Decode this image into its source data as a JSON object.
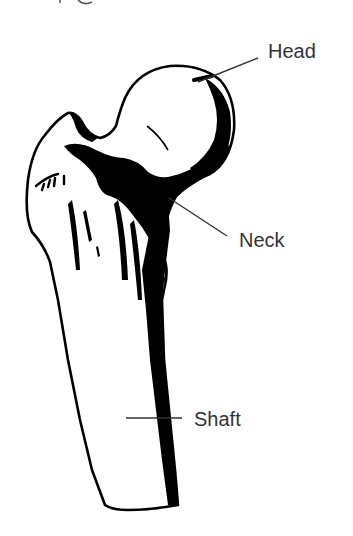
{
  "figure": {
    "top_caption_partial": "",
    "labels": {
      "head": "Head",
      "neck": "Neck",
      "shaft": "Shaft"
    },
    "colors": {
      "ink": "#000000",
      "label_text": "#333333",
      "leader_line": "#333333",
      "background": "#ffffff"
    }
  }
}
